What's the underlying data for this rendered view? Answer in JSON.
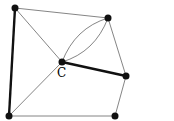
{
  "graph": {
    "nodes": [
      {
        "id": "TL",
        "x": 15,
        "y": 8
      },
      {
        "id": "TR",
        "x": 108,
        "y": 18
      },
      {
        "id": "C",
        "x": 62,
        "y": 62,
        "label": "C"
      },
      {
        "id": "R",
        "x": 126,
        "y": 76
      },
      {
        "id": "BL",
        "x": 9,
        "y": 116
      },
      {
        "id": "BR",
        "x": 115,
        "y": 116
      }
    ],
    "edges": [
      {
        "from": "TL",
        "to": "TR",
        "bold": false
      },
      {
        "from": "TL",
        "to": "BL",
        "bold": true
      },
      {
        "from": "TL",
        "to": "C",
        "bold": false
      },
      {
        "from": "C",
        "to": "BL",
        "bold": false
      },
      {
        "from": "C",
        "to": "R",
        "bold": true
      },
      {
        "from": "C",
        "to": "TR",
        "bold": false,
        "multi": 2
      },
      {
        "from": "TR",
        "to": "R",
        "bold": false
      },
      {
        "from": "R",
        "to": "BR",
        "bold": false
      },
      {
        "from": "BL",
        "to": "BR",
        "bold": false
      }
    ],
    "center_label": "C"
  }
}
